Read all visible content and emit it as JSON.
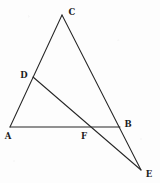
{
  "figure": {
    "background_color": "#fdfdfd",
    "stroke_color": "#262626",
    "label_color": "#1c1c1c",
    "width": 160,
    "height": 183,
    "points": {
      "A": {
        "label": "A",
        "x": 10,
        "y": 127,
        "label_x": 8,
        "label_y": 136
      },
      "B": {
        "label": "B",
        "x": 120,
        "y": 127,
        "label_x": 128,
        "label_y": 124
      },
      "C": {
        "label": "C",
        "x": 62,
        "y": 15,
        "label_x": 72,
        "label_y": 12
      },
      "D": {
        "label": "D",
        "x": 33,
        "y": 77,
        "label_x": 24,
        "label_y": 75
      },
      "E": {
        "label": "E",
        "x": 141,
        "y": 170,
        "label_x": 149,
        "label_y": 174
      },
      "F": {
        "label": "F",
        "x": 83,
        "y": 127,
        "label_x": 84,
        "label_y": 136
      }
    },
    "segments": [
      {
        "name": "segment-A-C",
        "from": "A",
        "to": "C"
      },
      {
        "name": "segment-A-B",
        "from": "A",
        "to": "B"
      },
      {
        "name": "segment-C-E",
        "from": "C",
        "to": "E"
      },
      {
        "name": "segment-D-E",
        "from": "D",
        "to": "E"
      }
    ]
  }
}
